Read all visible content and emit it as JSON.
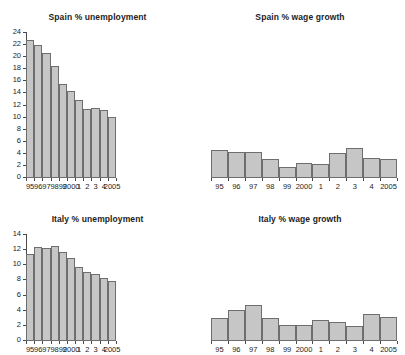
{
  "figure": {
    "width": 405,
    "height": 355,
    "background": "#ffffff",
    "bar_fill": "#c6c6c6",
    "bar_edge": "#6e6e6e",
    "axis_color": "#4a4a4a",
    "text_color": "#1c1c1c",
    "cropped_header": "",
    "panel_count": 4
  },
  "chart_data": [
    {
      "id": "spain-unemployment",
      "type": "bar",
      "title": "Spain % unemployment",
      "xlabel": "",
      "ylabel": "",
      "categories": [
        "95",
        "96",
        "97",
        "98",
        "99",
        "2000",
        "1",
        "2",
        "3",
        "4",
        "2005"
      ],
      "values": [
        22.7,
        21.9,
        20.5,
        18.3,
        15.4,
        14.2,
        12.7,
        11.3,
        11.5,
        11.1,
        10.0
      ],
      "ylim": [
        0,
        24
      ],
      "yticks": [
        0,
        2,
        4,
        6,
        8,
        10,
        12,
        14,
        16,
        18,
        20,
        22,
        24
      ],
      "ytick_labels": [
        "0",
        "2",
        "4",
        "6",
        "8",
        "10",
        "12",
        "14",
        "16",
        "18",
        "20",
        "22",
        "24"
      ],
      "grid": false,
      "legend": "none",
      "axis_visible": true
    },
    {
      "id": "spain-wage-growth",
      "type": "bar",
      "title": "Spain % wage growth",
      "xlabel": "",
      "ylabel": "",
      "categories": [
        "95",
        "96",
        "97",
        "98",
        "99",
        "2000",
        "1",
        "2",
        "3",
        "4",
        "2005"
      ],
      "values": [
        4.5,
        4.1,
        4.1,
        2.9,
        1.7,
        2.4,
        2.2,
        3.9,
        4.8,
        3.1,
        2.9
      ],
      "ylim": [
        0,
        24
      ],
      "yticks": [],
      "ytick_labels": [],
      "grid": false,
      "legend": "none",
      "axis_visible": false
    },
    {
      "id": "italy-unemployment",
      "type": "bar",
      "title": "Italy % unemployment",
      "xlabel": "",
      "ylabel": "",
      "categories": [
        "95",
        "96",
        "97",
        "98",
        "99",
        "2000",
        "1",
        "2",
        "3",
        "4",
        "2005"
      ],
      "values": [
        11.3,
        12.3,
        12.1,
        12.4,
        11.6,
        10.8,
        9.6,
        9.0,
        8.7,
        8.2,
        7.8
      ],
      "ylim": [
        0,
        14
      ],
      "yticks": [
        0,
        2,
        4,
        6,
        8,
        10,
        12,
        14
      ],
      "ytick_labels": [
        "0",
        "2",
        "4",
        "6",
        "8",
        "10",
        "12",
        "14"
      ],
      "grid": false,
      "legend": "none",
      "axis_visible": true
    },
    {
      "id": "italy-wage-growth",
      "type": "bar",
      "title": "Italy % wage growth",
      "xlabel": "",
      "ylabel": "",
      "categories": [
        "95",
        "96",
        "97",
        "98",
        "99",
        "2000",
        "1",
        "2",
        "3",
        "4",
        "2005"
      ],
      "values": [
        2.9,
        3.9,
        4.6,
        2.9,
        2.0,
        2.0,
        2.7,
        2.4,
        1.9,
        3.4,
        3.1
      ],
      "ylim": [
        0,
        14
      ],
      "yticks": [],
      "ytick_labels": [],
      "grid": false,
      "legend": "none",
      "axis_visible": false
    }
  ]
}
